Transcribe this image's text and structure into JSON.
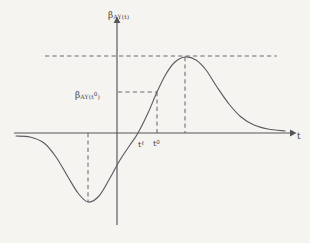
{
  "figure": {
    "background_color": "#f6f4f1",
    "ink_color": "#55545a",
    "curve_color": "#5d5c62",
    "dash_color": "#6a696f"
  },
  "labels": {
    "y_axis_title": {
      "base": "β",
      "sub": "AY(t)"
    },
    "y_value_marker": {
      "base": "β",
      "sub": "AY(t",
      "sup": "0",
      "sub_close": ")"
    },
    "tick_t_ell": {
      "base": "t",
      "sup": "ℓ"
    },
    "tick_t_zero": {
      "base": "t",
      "sup": "0"
    },
    "x_axis_title": {
      "base": "t"
    }
  },
  "chart_data": {
    "type": "line",
    "title": "",
    "xlabel": "t",
    "ylabel": "β_AY(t)",
    "grid": false,
    "legend": null,
    "axes": {
      "origin_px": {
        "x": 117,
        "y": 133
      },
      "x_axis_px": {
        "start": 14,
        "end": 293,
        "y": 133,
        "arrow": "right"
      },
      "y_axis_px": {
        "top": 20,
        "bottom": 225,
        "x": 117,
        "arrow": "up"
      },
      "xlim_note": "unlabeled continuous time axis",
      "ylim_note": "unlabeled response magnitude axis, zero at t-axis"
    },
    "series": [
      {
        "name": "beta_AY(t)",
        "description": "Impulse response: flat near zero at far left, dips to a negative trough, crosses zero at t-ell, rises to a positive peak, then decays asymptotically back to zero.",
        "points_px": [
          {
            "x": 16,
            "y": 136
          },
          {
            "x": 30,
            "y": 137
          },
          {
            "x": 44,
            "y": 143
          },
          {
            "x": 56,
            "y": 157
          },
          {
            "x": 68,
            "y": 177
          },
          {
            "x": 78,
            "y": 193
          },
          {
            "x": 88,
            "y": 202
          },
          {
            "x": 99,
            "y": 196
          },
          {
            "x": 110,
            "y": 178
          },
          {
            "x": 120,
            "y": 160
          },
          {
            "x": 130,
            "y": 145
          },
          {
            "x": 138,
            "y": 133
          },
          {
            "x": 148,
            "y": 113
          },
          {
            "x": 157,
            "y": 92
          },
          {
            "x": 166,
            "y": 74
          },
          {
            "x": 175,
            "y": 62
          },
          {
            "x": 185,
            "y": 57
          },
          {
            "x": 196,
            "y": 60
          },
          {
            "x": 206,
            "y": 70
          },
          {
            "x": 217,
            "y": 87
          },
          {
            "x": 229,
            "y": 104
          },
          {
            "x": 241,
            "y": 117
          },
          {
            "x": 254,
            "y": 125
          },
          {
            "x": 268,
            "y": 129
          },
          {
            "x": 285,
            "y": 131
          }
        ]
      }
    ],
    "annotations": [
      {
        "name": "peak-level-guide",
        "kind": "horizontal-dashed",
        "y_px": 56,
        "x_start_px": 45,
        "x_end_px": 277,
        "meaning": "maximum response level"
      },
      {
        "name": "peak-time-guide",
        "kind": "vertical-dashed",
        "x_px": 185,
        "y_start_px": 57,
        "y_end_px": 133,
        "meaning": "time of maximum response"
      },
      {
        "name": "t0-level-guide",
        "kind": "horizontal-dashed",
        "y_px": 92,
        "x_start_px": 118,
        "x_end_px": 157,
        "meaning": "response value at t-zero"
      },
      {
        "name": "t0-time-guide",
        "kind": "vertical-dashed",
        "x_px": 157,
        "y_start_px": 92,
        "y_end_px": 133,
        "meaning": "t-zero on the time axis"
      },
      {
        "name": "trough-time-guide",
        "kind": "vertical-dashed",
        "x_px": 88,
        "y_start_px": 133,
        "y_end_px": 202,
        "meaning": "time of minimum response"
      }
    ],
    "tick_labels": [
      {
        "label": "t^ℓ",
        "x_px": 138,
        "meaning": "zero crossing time"
      },
      {
        "label": "t^0",
        "x_px": 157,
        "meaning": "reference time"
      }
    ]
  }
}
